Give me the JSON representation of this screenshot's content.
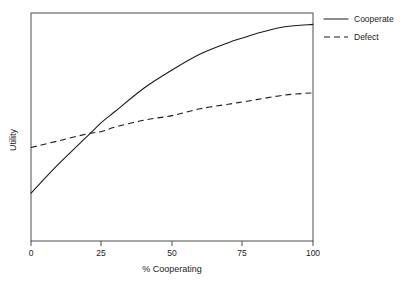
{
  "chart_data": {
    "type": "line",
    "title": "",
    "subtitle": "",
    "xlabel": "% Cooperating",
    "ylabel": "Utility",
    "xlim": [
      0,
      100
    ],
    "ylim": [
      0,
      100
    ],
    "grid": false,
    "legend_position": "top-right-outside",
    "x_ticks": [
      0,
      25,
      50,
      75,
      100
    ],
    "x_tick_labels": [
      "0",
      "25",
      "50",
      "75",
      "100"
    ],
    "y_ticks": [],
    "y_tick_labels": [],
    "annotations": [],
    "crossover_x": 29,
    "x": [
      0,
      10,
      20,
      25,
      30,
      40,
      50,
      60,
      70,
      75,
      80,
      90,
      100
    ],
    "series": [
      {
        "name": "Cooperate",
        "style": "solid",
        "color": "#1a1a1a",
        "values": [
          21,
          34,
          46,
          52,
          57,
          67,
          75,
          82,
          87,
          89,
          91,
          94,
          95
        ]
      },
      {
        "name": "Defect",
        "style": "dashed",
        "color": "#1a1a1a",
        "values": [
          41,
          44,
          47,
          48,
          50,
          53,
          55,
          58,
          60,
          61,
          62,
          64,
          65
        ]
      }
    ]
  },
  "legend": {
    "items": [
      {
        "label": "Cooperate",
        "style": "solid"
      },
      {
        "label": "Defect",
        "style": "dashed"
      }
    ]
  },
  "axes": {
    "x_title": "% Cooperating",
    "y_title": "Utility",
    "x_tick_labels": [
      "0",
      "25",
      "50",
      "75",
      "100"
    ]
  }
}
